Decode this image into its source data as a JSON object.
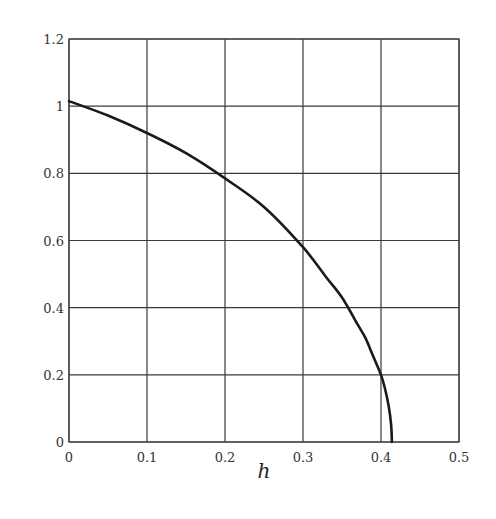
{
  "chart_data": {
    "type": "line",
    "title": "",
    "xlabel": "h",
    "ylabel": "",
    "xlim": [
      0,
      0.5
    ],
    "ylim": [
      0,
      1.2
    ],
    "grid": true,
    "legend": null,
    "x_ticks": [
      "0",
      "0.1",
      "0.2",
      "0.3",
      "0.4",
      "0.5"
    ],
    "y_ticks": [
      "0",
      "0.2",
      "0.4",
      "0.6",
      "0.8",
      "1",
      "1.2"
    ],
    "x_tick_values": [
      0,
      0.1,
      0.2,
      0.3,
      0.4,
      0.5
    ],
    "y_tick_values": [
      0,
      0.2,
      0.4,
      0.6,
      0.8,
      1.0,
      1.2
    ],
    "series": [
      {
        "name": "curve",
        "color": "#1a1a1a",
        "x": [
          0,
          0.05,
          0.1,
          0.15,
          0.2,
          0.25,
          0.3,
          0.33,
          0.35,
          0.37,
          0.38,
          0.39,
          0.4,
          0.405,
          0.41,
          0.413,
          0.414
        ],
        "y": [
          1.015,
          0.972,
          0.92,
          0.86,
          0.785,
          0.7,
          0.58,
          0.49,
          0.43,
          0.35,
          0.31,
          0.255,
          0.2,
          0.16,
          0.105,
          0.05,
          0.0
        ]
      }
    ]
  },
  "style": {
    "frame_color": "#444444",
    "grid_color": "#3a3a3a",
    "line_color": "#1a1a1a",
    "background": "#ffffff"
  }
}
